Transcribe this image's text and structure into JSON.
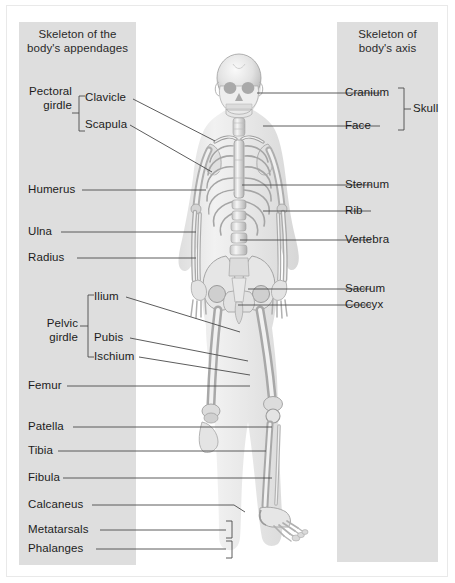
{
  "figure": {
    "kind": "anatomy-diagram",
    "colors": {
      "panel_gray": "#dedede",
      "background": "#ffffff",
      "text": "#1c1c1c",
      "leader_line": "#4a4a4a",
      "bone_light": "#f2f2f2",
      "bone_mid": "#c9c9c9",
      "bone_dark": "#9a9a9a",
      "body_silhouette": "#e8e8e8"
    }
  },
  "panels": {
    "left": {
      "title_line1": "Skeleton of the",
      "title_line2": "body's appendages"
    },
    "right": {
      "title_line1": "Skeleton of",
      "title_line2": "body's axis"
    }
  },
  "labels_left": [
    {
      "id": "pectoral-girdle",
      "text": "Pectoral\ngirdle",
      "line1": "Pectoral",
      "line2": "girdle",
      "group": true
    },
    {
      "id": "clavicle",
      "text": "Clavicle"
    },
    {
      "id": "scapula",
      "text": "Scapula"
    },
    {
      "id": "humerus",
      "text": "Humerus"
    },
    {
      "id": "ulna",
      "text": "Ulna"
    },
    {
      "id": "radius",
      "text": "Radius"
    },
    {
      "id": "pelvic-girdle",
      "text": "Pelvic\ngirdle",
      "line1": "Pelvic",
      "line2": "girdle",
      "group": true
    },
    {
      "id": "ilium",
      "text": "Ilium"
    },
    {
      "id": "pubis",
      "text": "Pubis"
    },
    {
      "id": "ischium",
      "text": "Ischium"
    },
    {
      "id": "femur",
      "text": "Femur"
    },
    {
      "id": "patella",
      "text": "Patella"
    },
    {
      "id": "tibia",
      "text": "Tibia"
    },
    {
      "id": "fibula",
      "text": "Fibula"
    },
    {
      "id": "calcaneus",
      "text": "Calcaneus"
    },
    {
      "id": "metatarsals",
      "text": "Metatarsals"
    },
    {
      "id": "phalanges",
      "text": "Phalanges"
    }
  ],
  "labels_right": [
    {
      "id": "cranium",
      "text": "Cranium"
    },
    {
      "id": "face",
      "text": "Face"
    },
    {
      "id": "skull",
      "text": "Skull",
      "group": true
    },
    {
      "id": "sternum",
      "text": "Sternum"
    },
    {
      "id": "rib",
      "text": "Rib"
    },
    {
      "id": "vertebra",
      "text": "Vertebra"
    },
    {
      "id": "sacrum",
      "text": "Sacrum"
    },
    {
      "id": "coccyx",
      "text": "Coccyx"
    }
  ]
}
